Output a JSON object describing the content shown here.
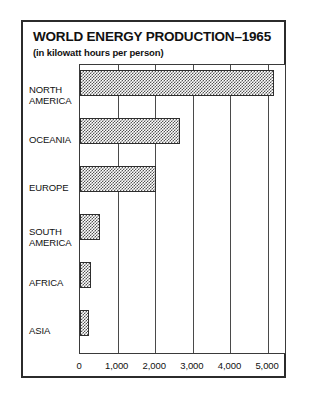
{
  "chart_data": {
    "type": "bar",
    "orientation": "horizontal",
    "title": "WORLD ENERGY PRODUCTION–1965",
    "subtitle": "(in kilowatt hours per person)",
    "xlabel": "",
    "ylabel": "",
    "categories": [
      "NORTH AMERICA",
      "OCEANIA",
      "EUROPE",
      "SOUTH AMERICA",
      "AFRICA",
      "ASIA"
    ],
    "category_lines": [
      [
        "NORTH",
        "AMERICA"
      ],
      [
        "OCEANIA"
      ],
      [
        "EUROPE"
      ],
      [
        "SOUTH",
        "AMERICA"
      ],
      [
        "AFRICA"
      ],
      [
        "ASIA"
      ]
    ],
    "values": [
      5150,
      2670,
      2030,
      520,
      300,
      240
    ],
    "xlim": [
      0,
      5450
    ],
    "xticks": [
      0,
      1000,
      2000,
      3000,
      4000,
      5000
    ],
    "xticklabels": [
      "0",
      "1,000",
      "2,000",
      "3,000",
      "4,000",
      "5,000"
    ],
    "grid": "vertical",
    "legend": "none",
    "bar_fill": "checkerboard-halftone",
    "bar_edge_color": "#2e2e2e",
    "frame_color": "#2b2b2b",
    "background_color": "#ffffff"
  }
}
